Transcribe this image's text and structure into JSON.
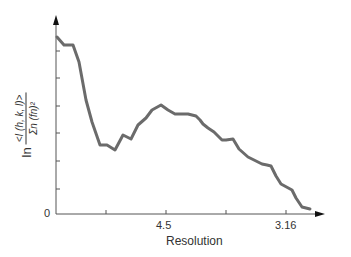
{
  "chart_data": {
    "type": "line",
    "title": "",
    "xlabel": "Resolution",
    "ylabel_prefix": "ln",
    "ylabel_numerator": "<I (h, k, l)>",
    "ylabel_denominator": "Σn (fn)²",
    "x_tick_labels": [
      {
        "position": 2,
        "label": "4.5"
      },
      {
        "position": 4,
        "label": "3.16"
      }
    ],
    "x_ticks_count": 4,
    "y_ticks_count": 7,
    "y_origin_label": "0",
    "grid": false,
    "legend": null,
    "series": [
      {
        "name": "intensity",
        "color": "#6b6b6b",
        "points_px": [
          [
            57,
            37
          ],
          [
            64,
            45
          ],
          [
            73,
            45
          ],
          [
            79,
            62
          ],
          [
            86,
            100
          ],
          [
            92,
            122
          ],
          [
            100,
            145
          ],
          [
            107,
            145
          ],
          [
            115,
            150
          ],
          [
            123,
            135
          ],
          [
            131,
            139
          ],
          [
            138,
            125
          ],
          [
            146,
            118
          ],
          [
            152,
            110
          ],
          [
            161,
            105
          ],
          [
            168,
            110
          ],
          [
            175,
            114
          ],
          [
            188,
            114
          ],
          [
            196,
            116
          ],
          [
            200,
            120
          ],
          [
            203,
            124
          ],
          [
            208,
            128
          ],
          [
            214,
            132
          ],
          [
            222,
            140
          ],
          [
            226,
            140
          ],
          [
            233,
            139
          ],
          [
            239,
            149
          ],
          [
            248,
            157
          ],
          [
            256,
            161
          ],
          [
            262,
            164
          ],
          [
            267,
            165
          ],
          [
            271,
            166
          ],
          [
            276,
            176
          ],
          [
            281,
            184
          ],
          [
            292,
            190
          ],
          [
            296,
            198
          ],
          [
            302,
            207
          ],
          [
            310,
            209
          ]
        ]
      }
    ]
  },
  "axes": {
    "origin_px": [
      56,
      214
    ],
    "x_end_px": 325,
    "y_top_px": 15,
    "x_tick_px": [
      106,
      166,
      226,
      286
    ],
    "y_tick_px": [
      51,
      78,
      106,
      133,
      161,
      189
    ],
    "axis_color": "#555555",
    "line_color": "#6b6b6b"
  }
}
